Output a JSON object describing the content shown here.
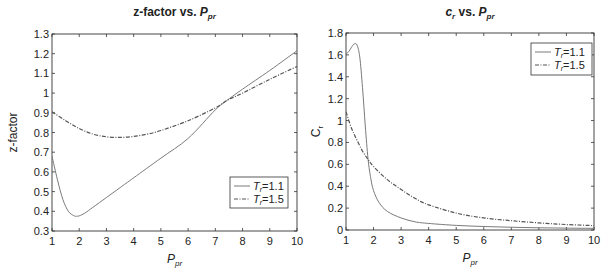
{
  "colors": {
    "axes": "#333333",
    "solid_series": "#7a7a7a",
    "dashed_series": "#555555",
    "background": "#ffffff"
  },
  "chart_data": [
    {
      "type": "line",
      "title": "z-factor vs. P_pr",
      "title_parts": {
        "main": "z-factor vs. ",
        "var": "P",
        "sub": "pr"
      },
      "xlabel": "P_pr",
      "xlabel_parts": {
        "var": "P",
        "sub": "pr"
      },
      "ylabel": "z-factor",
      "xlim": [
        1,
        10
      ],
      "ylim": [
        0.3,
        1.3
      ],
      "xticks": [
        1,
        2,
        3,
        4,
        5,
        6,
        7,
        8,
        9,
        10
      ],
      "xtick_labels": [
        "1",
        "2",
        "3",
        "4",
        "5",
        "6",
        "7",
        "8",
        "9",
        "10"
      ],
      "yticks": [
        0.3,
        0.4,
        0.5,
        0.6,
        0.7,
        0.8,
        0.9,
        1.0,
        1.1,
        1.2,
        1.3
      ],
      "ytick_labels": [
        "0.3",
        "0.4",
        "0.5",
        "0.6",
        "0.7",
        "0.8",
        "0.9",
        "1",
        "1.1",
        "1.2",
        "1.3"
      ],
      "grid": false,
      "legend_position": "lower right",
      "series": [
        {
          "name": "T_r=1.1",
          "legend_label": {
            "var": "T",
            "sub": "r",
            "rest": "=1.1"
          },
          "style": "solid",
          "x": [
            1.0,
            1.2,
            1.4,
            1.6,
            1.8,
            1.9,
            2.0,
            2.2,
            2.5,
            3.0,
            3.5,
            4.0,
            5.0,
            6.0,
            7.0,
            7.45,
            8.0,
            9.0,
            10.0
          ],
          "values": [
            0.68,
            0.56,
            0.46,
            0.4,
            0.378,
            0.375,
            0.377,
            0.39,
            0.42,
            0.47,
            0.52,
            0.57,
            0.67,
            0.77,
            0.915,
            0.965,
            1.02,
            1.115,
            1.215
          ]
        },
        {
          "name": "T_r=1.5",
          "legend_label": {
            "var": "T",
            "sub": "r",
            "rest": "=1.5"
          },
          "style": "dashdot",
          "x": [
            1.0,
            1.5,
            2.0,
            2.5,
            3.0,
            3.5,
            4.0,
            4.5,
            5.0,
            6.0,
            7.0,
            7.45,
            8.0,
            9.0,
            10.0
          ],
          "values": [
            0.905,
            0.86,
            0.82,
            0.792,
            0.778,
            0.775,
            0.78,
            0.792,
            0.81,
            0.86,
            0.925,
            0.965,
            1.0,
            1.07,
            1.135
          ]
        }
      ]
    },
    {
      "type": "line",
      "title": "c_r vs. P_pr",
      "title_parts": {
        "var1": "c",
        "sub1": "r",
        "main": " vs. ",
        "var": "P",
        "sub": "pr"
      },
      "xlabel": "P_pr",
      "xlabel_parts": {
        "var": "P",
        "sub": "pr"
      },
      "ylabel": "C_r",
      "ylabel_parts": {
        "var": "C",
        "sub": "r"
      },
      "xlim": [
        1,
        10
      ],
      "ylim": [
        0,
        1.8
      ],
      "xticks": [
        1,
        2,
        3,
        4,
        5,
        6,
        7,
        8,
        9,
        10
      ],
      "xtick_labels": [
        "1",
        "2",
        "3",
        "4",
        "5",
        "6",
        "7",
        "8",
        "9",
        "10"
      ],
      "yticks": [
        0,
        0.2,
        0.4,
        0.6,
        0.8,
        1.0,
        1.2,
        1.4,
        1.6,
        1.8
      ],
      "ytick_labels": [
        "0",
        "0.2",
        "0.4",
        "0.6",
        "0.8",
        "1",
        "1.2",
        "1.4",
        "1.6",
        "1.8"
      ],
      "grid": false,
      "legend_position": "upper right",
      "series": [
        {
          "name": "T_r=1.1",
          "legend_label": {
            "var": "T",
            "sub": "r",
            "rest": "=1.1"
          },
          "style": "solid",
          "x": [
            1.0,
            1.1,
            1.2,
            1.3,
            1.4,
            1.5,
            1.6,
            1.7,
            1.8,
            1.9,
            2.0,
            2.2,
            2.5,
            3.0,
            3.5,
            4.0,
            5.0,
            6.0,
            7.0,
            8.0,
            9.0,
            10.0
          ],
          "values": [
            1.61,
            1.63,
            1.67,
            1.7,
            1.69,
            1.58,
            1.3,
            0.95,
            0.65,
            0.47,
            0.36,
            0.25,
            0.17,
            0.11,
            0.075,
            0.06,
            0.042,
            0.032,
            0.025,
            0.02,
            0.017,
            0.015
          ]
        },
        {
          "name": "T_r=1.5",
          "legend_label": {
            "var": "T",
            "sub": "r",
            "rest": "=1.5"
          },
          "style": "dashdot",
          "x": [
            1.0,
            1.2,
            1.4,
            1.6,
            1.8,
            2.0,
            2.5,
            3.0,
            3.5,
            4.0,
            5.0,
            6.0,
            7.0,
            8.0,
            9.0,
            10.0
          ],
          "values": [
            1.08,
            0.93,
            0.82,
            0.72,
            0.645,
            0.58,
            0.46,
            0.37,
            0.29,
            0.23,
            0.155,
            0.11,
            0.085,
            0.065,
            0.05,
            0.04
          ]
        }
      ]
    }
  ],
  "layout": {
    "panels": [
      {
        "plot": {
          "x0": 52,
          "y0": 34,
          "x1": 297,
          "y1": 231
        },
        "title_y": 16,
        "legend": {
          "x": 230,
          "y": 177,
          "w": 58,
          "h": 31
        },
        "ylabel_x": 13
      },
      {
        "plot": {
          "x0": 346,
          "y0": 33,
          "x1": 594,
          "y1": 230
        },
        "title_y": 16,
        "legend": {
          "x": 531,
          "y": 43,
          "w": 61,
          "h": 32
        },
        "ylabel_x": 316
      }
    ]
  }
}
